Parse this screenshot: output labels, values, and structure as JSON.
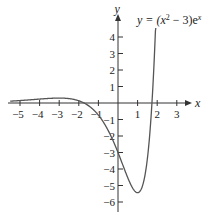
{
  "chart_data": {
    "type": "line",
    "title_parts": {
      "lhs": "y = (x",
      "exp1": "2",
      "mid": " − 3)e",
      "exp2": "x"
    },
    "xlabel": "x",
    "ylabel": "y",
    "function": "(x^2 - 3) * exp(x)",
    "xlim": [
      -5.5,
      3.6
    ],
    "ylim": [
      -6.6,
      4.9
    ],
    "x_ticks": [
      -5,
      -4,
      -3,
      -2,
      -1,
      1,
      2,
      3
    ],
    "x_tick_labels": [
      "−5",
      "−4",
      "−3",
      "−2",
      "−1",
      "1",
      "2",
      "3"
    ],
    "y_ticks": [
      4,
      3,
      2,
      1,
      -1,
      -2,
      -3,
      -4,
      -5,
      -6
    ],
    "y_tick_labels": [
      "4",
      "3",
      "2",
      "1",
      "−1",
      "−2",
      "−3",
      "−4",
      "−5",
      "−6"
    ],
    "grid": false,
    "legend": null,
    "series": [
      {
        "name": "y = (x² − 3)eˣ",
        "x": [
          -5.5,
          -5,
          -4,
          -3,
          -2,
          -1,
          -0.5,
          0,
          0.5,
          1,
          1.5,
          1.732,
          2,
          2.05
        ],
        "values": [
          0.112,
          0.148,
          0.238,
          0.299,
          0.135,
          -0.736,
          -1.668,
          -3.0,
          -4.534,
          -5.437,
          -3.361,
          0.0,
          7.389,
          8.53
        ]
      }
    ],
    "key_points": {
      "local_max": {
        "x": -3,
        "y": 0.299
      },
      "local_min": {
        "x": 1,
        "y": -5.437
      },
      "roots": [
        -1.732,
        1.732
      ],
      "y_intercept": -3
    },
    "color": "#555555"
  }
}
